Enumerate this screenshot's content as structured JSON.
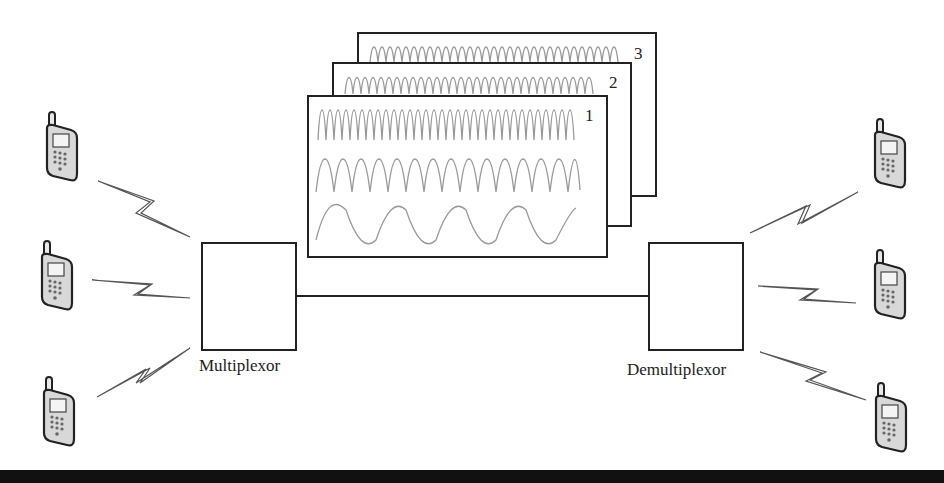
{
  "diagram": {
    "type": "frequency-division multiplexing",
    "multiplexor": {
      "label": "Multiplexor"
    },
    "demultiplexor": {
      "label": "Demultiplexor"
    },
    "frames": [
      {
        "number": "3",
        "signals": [
          "high-frequency"
        ]
      },
      {
        "number": "2",
        "signals": [
          "high-frequency"
        ]
      },
      {
        "number": "1",
        "signals": [
          "high-frequency",
          "medium-frequency",
          "low-frequency"
        ]
      }
    ],
    "left_devices": [
      {
        "icon": "mobile-phone-icon",
        "link": "wireless-link"
      },
      {
        "icon": "mobile-phone-icon",
        "link": "wireless-link"
      },
      {
        "icon": "mobile-phone-icon",
        "link": "wireless-link"
      }
    ],
    "right_devices": [
      {
        "icon": "mobile-phone-icon",
        "link": "wireless-link"
      },
      {
        "icon": "mobile-phone-icon",
        "link": "wireless-link"
      },
      {
        "icon": "mobile-phone-icon",
        "link": "wireless-link"
      }
    ],
    "colors": {
      "stroke": "#222222",
      "wave": "#9a9a9a",
      "phone_fill": "#d8d8d8",
      "bottom_bar": "#111111"
    }
  }
}
